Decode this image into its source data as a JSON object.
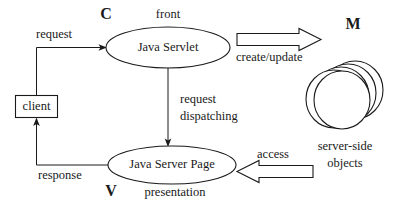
{
  "diagram": {
    "nodes": {
      "client": {
        "label": "client",
        "shape": "rectangle"
      },
      "servlet": {
        "label": "Java Servlet",
        "shape": "ellipse"
      },
      "jsp": {
        "label": "Java Server Page",
        "shape": "ellipse"
      },
      "objects": {
        "label": "server-side objects",
        "shape": "disc-stack"
      }
    },
    "role_letters": {
      "controller": "C",
      "view": "V",
      "model": "M"
    },
    "annotations": {
      "servlet_role": "front",
      "jsp_role": "presentation",
      "objects_line1": "server-side",
      "objects_line2": "objects"
    },
    "edges": {
      "request": "request",
      "request_dispatching_line1": "request",
      "request_dispatching_line2": "dispatching",
      "response": "response",
      "create_update": "create/update",
      "access": "access"
    },
    "colors": {
      "stroke": "#1a1a1a",
      "background": "#ffffff"
    }
  }
}
